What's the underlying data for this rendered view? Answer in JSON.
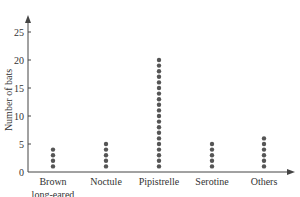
{
  "chart_data": {
    "type": "dot",
    "title": "",
    "xlabel": "",
    "ylabel": "Number of bats",
    "categories": [
      "Brown long-eared",
      "Noctule",
      "Pipistrelle",
      "Serotine",
      "Others"
    ],
    "category_label_lines": [
      [
        "Brown",
        "long-eared"
      ],
      [
        "Noctule"
      ],
      [
        "Pipistrelle"
      ],
      [
        "Serotine"
      ],
      [
        "Others"
      ]
    ],
    "values": [
      4,
      5,
      20,
      5,
      6
    ],
    "ylim": [
      0,
      27
    ],
    "yticks": [
      0,
      5,
      10,
      15,
      20,
      25
    ],
    "grid": false,
    "legend": null,
    "colors": {
      "dot": "#555555",
      "axis": "#444444",
      "text": "#333333"
    }
  }
}
